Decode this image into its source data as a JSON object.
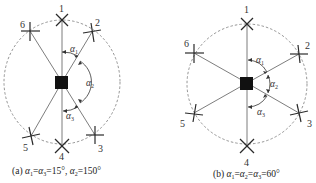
{
  "figure": {
    "panels": [
      {
        "id": "a",
        "caption_prefix": "(a) ",
        "caption_alpha1": "α",
        "caption_sub1": "1",
        "caption_eq1": "=",
        "caption_alpha3": "α",
        "caption_sub3": "3",
        "caption_eq2": "=15°,  ",
        "caption_alpha2": "α",
        "caption_sub2": "2",
        "caption_eq3": "=150°",
        "angles": {
          "alpha1": "15°",
          "alpha2": "150°",
          "alpha3": "15°"
        },
        "rotor_labels": [
          "1",
          "2",
          "3",
          "4",
          "5",
          "6"
        ],
        "angle_labels": [
          {
            "sym": "α",
            "sub": "1"
          },
          {
            "sym": "α",
            "sub": "2"
          },
          {
            "sym": "α",
            "sub": "3"
          }
        ]
      },
      {
        "id": "b",
        "caption_prefix": "(b) ",
        "caption_alpha1": "α",
        "caption_sub1": "1",
        "caption_eq1": "=",
        "caption_alpha2": "α",
        "caption_sub2": "2",
        "caption_eq2": "=",
        "caption_alpha3": "α",
        "caption_sub3": "3",
        "caption_eq3": "=60°",
        "angles": {
          "alpha1": "60°",
          "alpha2": "60°",
          "alpha3": "60°"
        },
        "rotor_labels": [
          "1",
          "2",
          "3",
          "4",
          "5",
          "6"
        ],
        "angle_labels": [
          {
            "sym": "α",
            "sub": "1"
          },
          {
            "sym": "α",
            "sub": "2"
          },
          {
            "sym": "α",
            "sub": "3"
          }
        ]
      }
    ],
    "colors": {
      "line": "#6e6e6e",
      "rotor": "#2a2a2a",
      "body": "#111111",
      "circle": "#7a7a7a",
      "text": "#333333"
    }
  }
}
